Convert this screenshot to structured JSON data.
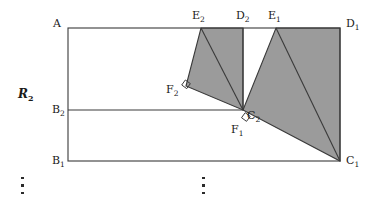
{
  "figure": {
    "colors": {
      "stroke": "#3a3a3a",
      "fill_gray": "#9b9b9b",
      "background": "#ffffff",
      "label_color": "#1a1a1a"
    },
    "region_label": {
      "base": "R",
      "sub": "2"
    },
    "vertices": [
      {
        "id": "A",
        "base": "A",
        "sub": "",
        "x": 68,
        "y": 28,
        "label_x": 53,
        "label_y": 18
      },
      {
        "id": "E2",
        "base": "E",
        "sub": "2",
        "x": 201,
        "y": 28,
        "label_x": 192,
        "label_y": 11
      },
      {
        "id": "D2",
        "base": "D",
        "sub": "2",
        "x": 243,
        "y": 28,
        "label_x": 236,
        "label_y": 11
      },
      {
        "id": "E1",
        "base": "E",
        "sub": "1",
        "x": 276,
        "y": 28,
        "label_x": 268,
        "label_y": 11
      },
      {
        "id": "D1",
        "base": "D",
        "sub": "1",
        "x": 340,
        "y": 28,
        "label_x": 346,
        "label_y": 18
      },
      {
        "id": "F2",
        "base": "F",
        "sub": "2",
        "x": 186,
        "y": 86,
        "label_x": 166,
        "label_y": 84
      },
      {
        "id": "B2",
        "base": "B",
        "sub": "2",
        "x": 68,
        "y": 110,
        "label_x": 52,
        "label_y": 104
      },
      {
        "id": "C2",
        "base": "C",
        "sub": "2",
        "x": 243,
        "y": 110,
        "label_x": 247,
        "label_y": 110
      },
      {
        "id": "F1",
        "base": "F",
        "sub": "1",
        "x": 248,
        "y": 121,
        "label_x": 231,
        "label_y": 124
      },
      {
        "id": "B1",
        "base": "B",
        "sub": "1",
        "x": 68,
        "y": 161,
        "label_x": 52,
        "label_y": 155
      },
      {
        "id": "C1",
        "base": "C",
        "sub": "1",
        "x": 340,
        "y": 161,
        "label_x": 346,
        "label_y": 155
      }
    ],
    "shaded_regions": [
      {
        "name": "left-shaded-quad",
        "points": "201,28 243,28 243,110 186,86"
      },
      {
        "name": "right-shaded-quad",
        "points": "276,28 340,28 340,161 243,110"
      }
    ],
    "internal_lines": [
      {
        "name": "line-e2-c2",
        "x1": 201,
        "y1": 28,
        "x2": 243,
        "y2": 110
      },
      {
        "name": "line-e1-c1",
        "x1": 276,
        "y1": 28,
        "x2": 340,
        "y2": 161
      },
      {
        "name": "line-d2-c2",
        "x1": 243,
        "y1": 28,
        "x2": 243,
        "y2": 110
      },
      {
        "name": "line-b2-c2",
        "x1": 68,
        "y1": 110,
        "x2": 243,
        "y2": 110
      }
    ],
    "outer_rectangle": {
      "x": 68,
      "y": 28,
      "width": 272,
      "height": 133
    },
    "right_angle_marks": [
      {
        "name": "right-angle-at-f2",
        "cx": 188,
        "cy": 84,
        "rotation": -54
      },
      {
        "name": "right-angle-at-f1",
        "cx": 246,
        "cy": 117,
        "rotation": -54
      }
    ],
    "ellipses": [
      {
        "name": "ellipsis-left",
        "x": 21,
        "y": 177
      },
      {
        "name": "ellipsis-center",
        "x": 202,
        "y": 177
      }
    ]
  }
}
